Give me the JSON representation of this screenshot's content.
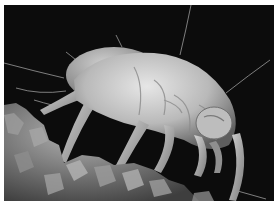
{
  "image": {
    "subject": "dust mite electron micrograph",
    "style": "grayscale scanning electron micrograph",
    "colors": {
      "background": "#0c0c0c",
      "body_light": "#d8d8d8",
      "body_mid": "#a8a8a8",
      "body_shadow": "#6a6a6a",
      "debris": "#8a8a8a",
      "border": "#ffffff"
    }
  }
}
